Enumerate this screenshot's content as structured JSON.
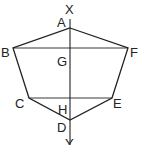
{
  "diagram": {
    "type": "geometry-figure",
    "shape": "hexagon ABCDEF",
    "axis": {
      "top_label": "X",
      "bottom_label": "Y"
    },
    "points": {
      "A": {
        "label": "A",
        "x": 70,
        "y": 28
      },
      "B": {
        "label": "B",
        "x": 13,
        "y": 48
      },
      "C": {
        "label": "C",
        "x": 29,
        "y": 98
      },
      "D": {
        "label": "D",
        "x": 70,
        "y": 120
      },
      "E": {
        "label": "E",
        "x": 112,
        "y": 98
      },
      "F": {
        "label": "F",
        "x": 128,
        "y": 48
      },
      "G": {
        "label": "G",
        "x": 70,
        "y": 48
      },
      "H": {
        "label": "H",
        "x": 70,
        "y": 98
      }
    },
    "segments": [
      "AB",
      "BC",
      "CD",
      "DE",
      "EF",
      "FA",
      "BF",
      "CE",
      "XY"
    ],
    "stroke_color": "#222222"
  }
}
